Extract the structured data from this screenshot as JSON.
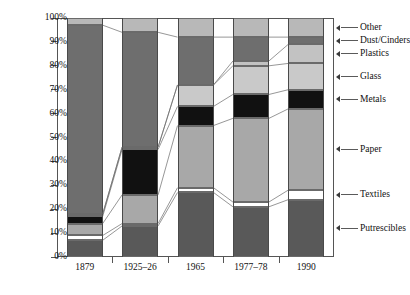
{
  "chart_data": {
    "type": "bar",
    "subtype": "stacked-percentage",
    "title": "",
    "xlabel": "",
    "ylabel": "",
    "ylim": [
      0,
      100
    ],
    "y_tick_labels": [
      "0%",
      "10%",
      "20%",
      "30%",
      "40%",
      "50%",
      "60%",
      "70%",
      "80%",
      "90%",
      "100%"
    ],
    "y_tick_values": [
      0,
      10,
      20,
      30,
      40,
      50,
      60,
      70,
      80,
      90,
      100
    ],
    "grid": false,
    "legend_position": "right-outside-with-leader-lines",
    "categories": [
      "1879",
      "1925–26",
      "1965",
      "1977–78",
      "1990"
    ],
    "series": [
      {
        "name": "Putrescibles",
        "values": [
          7,
          13,
          27,
          21,
          24
        ],
        "color": "#595959"
      },
      {
        "name": "Textiles",
        "values": [
          2,
          1,
          2,
          2,
          4
        ],
        "color": "#ffffff"
      },
      {
        "name": "Paper",
        "values": [
          5,
          12,
          26,
          35,
          34
        ],
        "color": "#a8a8a8"
      },
      {
        "name": "Metals",
        "values": [
          3,
          19,
          8,
          10,
          8
        ],
        "color": "#111111"
      },
      {
        "name": "Glass",
        "values": [
          1,
          1,
          9,
          12,
          11
        ],
        "color": "#c9c9c9"
      },
      {
        "name": "Plastics",
        "values": [
          0,
          0,
          0,
          2,
          8
        ],
        "color": "#c2c2c2"
      },
      {
        "name": "Dust/Cinders",
        "values": [
          79,
          48,
          20,
          10,
          3
        ],
        "color": "#6e6e6e"
      },
      {
        "name": "Other",
        "values": [
          3,
          6,
          8,
          8,
          8
        ],
        "color": "#b8b8b8"
      }
    ],
    "cumulative_tops": {
      "1879": {
        "Putrescibles": 7,
        "Textiles": 9,
        "Paper": 14,
        "Metals": 17,
        "Glass": 18,
        "Plastics": 18,
        "Dust/Cinders": 97,
        "Other": 100
      },
      "1925–26": {
        "Putrescibles": 13,
        "Textiles": 14,
        "Paper": 26,
        "Metals": 45,
        "Glass": 46,
        "Plastics": 46,
        "Dust/Cinders": 94,
        "Other": 100
      },
      "1965": {
        "Putrescibles": 27,
        "Textiles": 29,
        "Paper": 55,
        "Metals": 63,
        "Glass": 72,
        "Plastics": 72,
        "Dust/Cinders": 92,
        "Other": 100
      },
      "1977–78": {
        "Putrescibles": 21,
        "Textiles": 23,
        "Paper": 58,
        "Metals": 68,
        "Glass": 80,
        "Plastics": 82,
        "Dust/Cinders": 92,
        "Other": 100
      },
      "1990": {
        "Putrescibles": 24,
        "Textiles": 28,
        "Paper": 62,
        "Metals": 70,
        "Glass": 81,
        "Plastics": 89,
        "Dust/Cinders": 92,
        "Other": 100
      }
    }
  },
  "axis": {
    "y_ticks": [
      {
        "label": "0%",
        "value": 0
      },
      {
        "label": "10%",
        "value": 10
      },
      {
        "label": "20%",
        "value": 20
      },
      {
        "label": "30%",
        "value": 30
      },
      {
        "label": "40%",
        "value": 40
      },
      {
        "label": "50%",
        "value": 50
      },
      {
        "label": "60%",
        "value": 60
      },
      {
        "label": "70%",
        "value": 70
      },
      {
        "label": "80%",
        "value": 80
      },
      {
        "label": "90%",
        "value": 90
      },
      {
        "label": "100%",
        "value": 100
      }
    ],
    "x_ticks": [
      {
        "label": "1879"
      },
      {
        "label": "1925–26"
      },
      {
        "label": "1965"
      },
      {
        "label": "1977–78"
      },
      {
        "label": "1990"
      }
    ]
  },
  "legend": {
    "items": [
      {
        "label": "Other",
        "anchor_value": 96,
        "color": "#b8b8b8"
      },
      {
        "label": "Dust/Cinders",
        "anchor_value": 90.5,
        "color": "#6e6e6e"
      },
      {
        "label": "Plastics",
        "anchor_value": 85,
        "color": "#c2c2c2"
      },
      {
        "label": "Glass",
        "anchor_value": 75.5,
        "color": "#c9c9c9"
      },
      {
        "label": "Metals",
        "anchor_value": 66,
        "color": "#111111"
      },
      {
        "label": "Paper",
        "anchor_value": 45,
        "color": "#a8a8a8"
      },
      {
        "label": "Textiles",
        "anchor_value": 26,
        "color": "#ffffff"
      },
      {
        "label": "Putrescibles",
        "anchor_value": 12,
        "color": "#595959"
      }
    ]
  }
}
